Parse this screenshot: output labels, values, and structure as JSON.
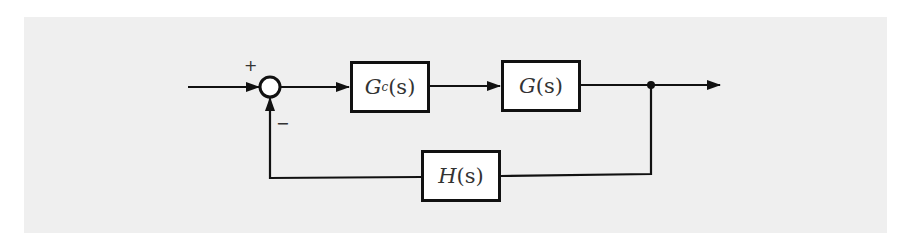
{
  "diagram": {
    "type": "closed-loop control block diagram",
    "summing_junction": {
      "plus_label": "+",
      "minus_label": "−"
    },
    "blocks": [
      {
        "id": "controller",
        "symbol": "G",
        "subscript": "c",
        "arg": "(s)",
        "label": "Gc(s)"
      },
      {
        "id": "plant",
        "symbol": "G",
        "subscript": "",
        "arg": "(s)",
        "label": "G(s)"
      },
      {
        "id": "feedback",
        "symbol": "H",
        "subscript": "",
        "arg": "(s)",
        "label": "H(s)"
      }
    ],
    "colors": {
      "background": "#efefef",
      "line": "#111111",
      "block_fill": "#ffffff"
    }
  }
}
